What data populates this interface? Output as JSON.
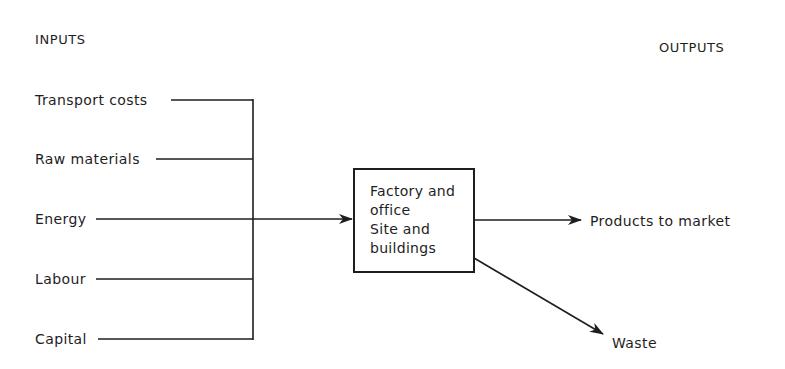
{
  "diagram": {
    "headers": {
      "inputs": "INPUTS",
      "outputs": "OUTPUTS"
    },
    "inputs": [
      {
        "label": "Transport costs"
      },
      {
        "label": "Raw materials"
      },
      {
        "label": "Energy"
      },
      {
        "label": "Labour"
      },
      {
        "label": "Capital"
      }
    ],
    "process": {
      "lines": [
        "Factory and",
        "office",
        "Site and",
        "buildings"
      ]
    },
    "outputs": [
      {
        "label": "Products to market"
      },
      {
        "label": "Waste"
      }
    ],
    "colors": {
      "ink": "#1e1e1e",
      "background": "#ffffff"
    }
  }
}
